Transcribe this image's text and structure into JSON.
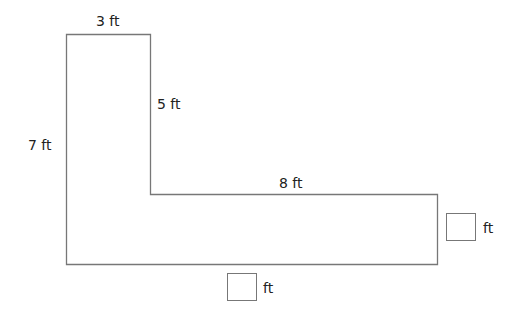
{
  "diagram": {
    "type": "l-shape-perimeter",
    "labels": {
      "top": "3 ft",
      "inner_vertical": "5 ft",
      "left": "7 ft",
      "inner_horizontal": "8 ft"
    },
    "unknowns": {
      "right": {
        "unit": "ft",
        "value": ""
      },
      "bottom": {
        "unit": "ft",
        "value": ""
      }
    },
    "colors": {
      "stroke": "#777777",
      "text": "#222222"
    }
  }
}
